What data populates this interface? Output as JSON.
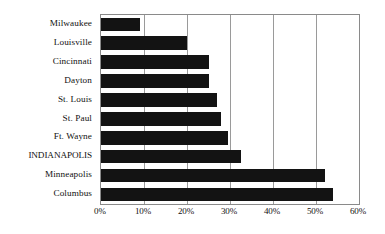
{
  "chart_data": {
    "type": "bar",
    "orientation": "horizontal",
    "title": "",
    "xlabel": "",
    "ylabel": "",
    "categories": [
      "Milwaukee",
      "Louisville",
      "Cincinnati",
      "Dayton",
      "St. Louis",
      "St. Paul",
      "Ft. Wayne",
      "INDIANAPOLIS",
      "Minneapolis",
      "Columbus"
    ],
    "values": [
      9,
      20,
      25,
      25,
      27,
      28,
      29.5,
      32.5,
      52,
      54
    ],
    "value_suffix": "%",
    "xlim": [
      0,
      60
    ],
    "xticks": [
      0,
      10,
      20,
      30,
      40,
      50,
      60
    ],
    "xtick_labels": [
      "0%",
      "10%",
      "20%",
      "30%",
      "40%",
      "50%",
      "60%"
    ],
    "grid": true,
    "grid_axis": "x",
    "legend": false,
    "highlight_category": "INDIANAPOLIS",
    "bar_color": "#131313",
    "grid_color": "#9a9a9a",
    "axis_color": "#8a8a8a",
    "background_color": "#ffffff"
  }
}
